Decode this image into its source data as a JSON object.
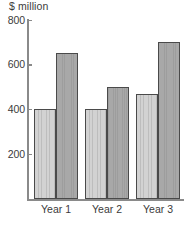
{
  "chart_data": {
    "type": "bar",
    "title": "",
    "subtitle": "",
    "xlabel": "",
    "ylabel": "$ million",
    "categories": [
      "Year 1",
      "Year 2",
      "Year 3"
    ],
    "series": [
      {
        "name": "Series 1",
        "values": [
          400,
          400,
          470
        ],
        "color": "#c9c9c9"
      },
      {
        "name": "Series 2",
        "values": [
          650,
          500,
          700
        ],
        "color": "#a3a3a3"
      }
    ],
    "ylim": [
      0,
      800
    ],
    "yticks": [
      200,
      400,
      600,
      800
    ],
    "ytick_labels": [
      "200",
      "400",
      "600",
      "800"
    ],
    "grid": false,
    "legend": "none",
    "axis_color": "#8a8a8a",
    "bar_outline_color": "#4a4a4a",
    "text_color": "#3b3b3b",
    "background": "#ffffff"
  }
}
